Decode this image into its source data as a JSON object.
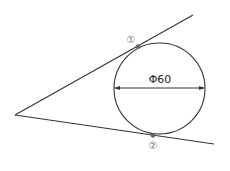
{
  "diagram": {
    "diameter_label": "Φ60",
    "tangent_points": [
      {
        "label": "①",
        "x": 138,
        "y": 46.5
      },
      {
        "label": "②",
        "x": 153,
        "y": 135.5
      }
    ],
    "circle": {
      "cx": 159.5,
      "cy": 88.5,
      "r": 45.5
    },
    "vertex": {
      "x": 15,
      "y": 115
    },
    "upper_line_end": {
      "x": 193,
      "y": 15
    },
    "lower_line_end": {
      "x": 214,
      "y": 144
    },
    "colors": {
      "line": "#333333",
      "point": "#666666",
      "marker_text": "#777777"
    }
  }
}
